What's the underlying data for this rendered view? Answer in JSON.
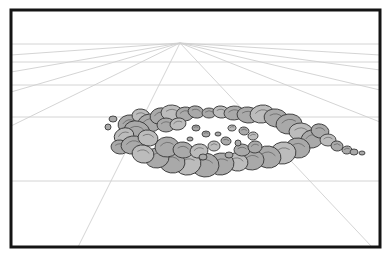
{
  "document": {
    "title": "Perspective Rock Ring Drawing",
    "type": "line-art-illustration",
    "subject": "ring of boulders on a one-point perspective ground plane",
    "canvas": {
      "width": 389,
      "height": 260,
      "background_color": "#ffffff"
    }
  },
  "frame": {
    "name": "illustration-border",
    "x": 11,
    "y": 10,
    "width": 369,
    "height": 237,
    "stroke_color": "#141414",
    "stroke_width": 3,
    "fill_color": "#ffffff"
  },
  "perspective_grid": {
    "line_color": "#cfcfcf",
    "line_width": 0.9,
    "vanishing_point": {
      "x": 180,
      "y": 43,
      "label": "vanishing point"
    },
    "horizon_note": "horizontal ground lines recede toward the vanishing point",
    "horizontal_lines_y": [
      44,
      62,
      85,
      117,
      181
    ],
    "radiating_lines": [
      {
        "id": "ray-left-1",
        "end_x": 11,
        "end_y": 55
      },
      {
        "id": "ray-left-2",
        "end_x": 11,
        "end_y": 72
      },
      {
        "id": "ray-left-3",
        "end_x": 11,
        "end_y": 92
      },
      {
        "id": "ray-left-4",
        "end_x": 11,
        "end_y": 126
      },
      {
        "id": "ray-bottom-left",
        "end_x": 78,
        "end_y": 247
      },
      {
        "id": "ray-right-1",
        "end_x": 380,
        "end_y": 55
      },
      {
        "id": "ray-right-2",
        "end_x": 380,
        "end_y": 70
      },
      {
        "id": "ray-right-3",
        "end_x": 380,
        "end_y": 90
      },
      {
        "id": "ray-right-4",
        "end_x": 380,
        "end_y": 122
      },
      {
        "id": "ray-bottom-right",
        "end_x": 372,
        "end_y": 247
      }
    ]
  },
  "rock_ring": {
    "name": "boulder-ring",
    "description": "elliptical ring of overlapping rounded boulders seen in perspective",
    "fill_color": "#a9a9a9",
    "fill_color_light": "#bcbcbc",
    "outline_color": "#3a3a3a",
    "outline_width": 0.9,
    "center": {
      "x": 222,
      "y": 136
    },
    "ellipse": {
      "rx": 105,
      "ry": 38
    },
    "interior_color": "#ffffff",
    "boulders": [
      {
        "cx": 129,
        "cy": 124,
        "rx": 11,
        "ry": 9,
        "rot": -12,
        "tone": "mid"
      },
      {
        "cx": 141,
        "cy": 116,
        "rx": 9,
        "ry": 7,
        "rot": 8,
        "tone": "light"
      },
      {
        "cx": 150,
        "cy": 123,
        "rx": 12,
        "ry": 9,
        "rot": -5,
        "tone": "mid"
      },
      {
        "cx": 137,
        "cy": 131,
        "rx": 13,
        "ry": 10,
        "rot": 14,
        "tone": "mid"
      },
      {
        "cx": 124,
        "cy": 136,
        "rx": 10,
        "ry": 8,
        "rot": -20,
        "tone": "light"
      },
      {
        "cx": 120,
        "cy": 147,
        "rx": 9,
        "ry": 7,
        "rot": 6,
        "tone": "mid"
      },
      {
        "cx": 133,
        "cy": 145,
        "rx": 12,
        "ry": 9,
        "rot": -8,
        "tone": "mid"
      },
      {
        "cx": 148,
        "cy": 138,
        "rx": 10,
        "ry": 8,
        "rot": 10,
        "tone": "light"
      },
      {
        "cx": 160,
        "cy": 116,
        "rx": 10,
        "ry": 8,
        "rot": -14,
        "tone": "mid"
      },
      {
        "cx": 172,
        "cy": 113,
        "rx": 11,
        "ry": 8,
        "rot": 4,
        "tone": "light"
      },
      {
        "cx": 185,
        "cy": 114,
        "rx": 9,
        "ry": 7,
        "rot": -6,
        "tone": "mid"
      },
      {
        "cx": 196,
        "cy": 112,
        "rx": 8,
        "ry": 6,
        "rot": 12,
        "tone": "mid"
      },
      {
        "cx": 166,
        "cy": 125,
        "rx": 9,
        "ry": 7,
        "rot": 0,
        "tone": "mid"
      },
      {
        "cx": 178,
        "cy": 124,
        "rx": 8,
        "ry": 6,
        "rot": -10,
        "tone": "light"
      },
      {
        "cx": 209,
        "cy": 113,
        "rx": 7,
        "ry": 5,
        "rot": 0,
        "tone": "mid"
      },
      {
        "cx": 221,
        "cy": 112,
        "rx": 8,
        "ry": 6,
        "rot": 8,
        "tone": "light"
      },
      {
        "cx": 234,
        "cy": 113,
        "rx": 10,
        "ry": 7,
        "rot": -4,
        "tone": "mid"
      },
      {
        "cx": 248,
        "cy": 115,
        "rx": 11,
        "ry": 8,
        "rot": 6,
        "tone": "mid"
      },
      {
        "cx": 262,
        "cy": 114,
        "rx": 12,
        "ry": 9,
        "rot": -8,
        "tone": "light"
      },
      {
        "cx": 276,
        "cy": 118,
        "rx": 12,
        "ry": 9,
        "rot": 10,
        "tone": "mid"
      },
      {
        "cx": 289,
        "cy": 124,
        "rx": 13,
        "ry": 10,
        "rot": -6,
        "tone": "mid"
      },
      {
        "cx": 301,
        "cy": 132,
        "rx": 12,
        "ry": 9,
        "rot": 4,
        "tone": "light"
      },
      {
        "cx": 312,
        "cy": 139,
        "rx": 11,
        "ry": 9,
        "rot": -12,
        "tone": "mid"
      },
      {
        "cx": 320,
        "cy": 131,
        "rx": 9,
        "ry": 7,
        "rot": 14,
        "tone": "mid"
      },
      {
        "cx": 328,
        "cy": 140,
        "rx": 8,
        "ry": 6,
        "rot": 0,
        "tone": "light"
      },
      {
        "cx": 337,
        "cy": 146,
        "rx": 6,
        "ry": 5,
        "rot": 8,
        "tone": "mid"
      },
      {
        "cx": 347,
        "cy": 150,
        "rx": 5,
        "ry": 4,
        "rot": -6,
        "tone": "mid"
      },
      {
        "cx": 298,
        "cy": 148,
        "rx": 12,
        "ry": 10,
        "rot": 6,
        "tone": "mid"
      },
      {
        "cx": 283,
        "cy": 153,
        "rx": 13,
        "ry": 11,
        "rot": -10,
        "tone": "light"
      },
      {
        "cx": 268,
        "cy": 157,
        "rx": 13,
        "ry": 11,
        "rot": 8,
        "tone": "mid"
      },
      {
        "cx": 252,
        "cy": 160,
        "rx": 12,
        "ry": 10,
        "rot": -4,
        "tone": "mid"
      },
      {
        "cx": 237,
        "cy": 162,
        "rx": 11,
        "ry": 9,
        "rot": 10,
        "tone": "light"
      },
      {
        "cx": 221,
        "cy": 164,
        "rx": 13,
        "ry": 11,
        "rot": -8,
        "tone": "mid"
      },
      {
        "cx": 205,
        "cy": 165,
        "rx": 14,
        "ry": 12,
        "rot": 5,
        "tone": "mid"
      },
      {
        "cx": 188,
        "cy": 164,
        "rx": 13,
        "ry": 11,
        "rot": -12,
        "tone": "light"
      },
      {
        "cx": 172,
        "cy": 162,
        "rx": 13,
        "ry": 11,
        "rot": 9,
        "tone": "mid"
      },
      {
        "cx": 157,
        "cy": 158,
        "rx": 12,
        "ry": 10,
        "rot": -6,
        "tone": "mid"
      },
      {
        "cx": 143,
        "cy": 154,
        "rx": 11,
        "ry": 9,
        "rot": 12,
        "tone": "light"
      },
      {
        "cx": 167,
        "cy": 147,
        "rx": 12,
        "ry": 10,
        "rot": -5,
        "tone": "mid"
      },
      {
        "cx": 183,
        "cy": 150,
        "rx": 10,
        "ry": 8,
        "rot": 7,
        "tone": "mid"
      },
      {
        "cx": 199,
        "cy": 151,
        "rx": 9,
        "ry": 7,
        "rot": -9,
        "tone": "light"
      },
      {
        "cx": 242,
        "cy": 150,
        "rx": 8,
        "ry": 6,
        "rot": 3,
        "tone": "mid"
      },
      {
        "cx": 255,
        "cy": 147,
        "rx": 7,
        "ry": 6,
        "rot": -7,
        "tone": "mid"
      },
      {
        "cx": 214,
        "cy": 146,
        "rx": 6,
        "ry": 5,
        "rot": 0,
        "tone": "light"
      },
      {
        "cx": 226,
        "cy": 141,
        "rx": 5,
        "ry": 4,
        "rot": 10,
        "tone": "mid"
      },
      {
        "cx": 206,
        "cy": 134,
        "rx": 4,
        "ry": 3,
        "rot": 0,
        "tone": "mid"
      },
      {
        "cx": 232,
        "cy": 128,
        "rx": 4,
        "ry": 3,
        "rot": -8,
        "tone": "light"
      },
      {
        "cx": 244,
        "cy": 131,
        "rx": 5,
        "ry": 4,
        "rot": 6,
        "tone": "mid"
      },
      {
        "cx": 196,
        "cy": 128,
        "rx": 4,
        "ry": 3,
        "rot": 0,
        "tone": "mid"
      },
      {
        "cx": 253,
        "cy": 136,
        "rx": 5,
        "ry": 4,
        "rot": -5,
        "tone": "light"
      }
    ],
    "scatter_stones": [
      {
        "cx": 354,
        "cy": 152,
        "rx": 4,
        "ry": 3
      },
      {
        "cx": 362,
        "cy": 153,
        "rx": 3,
        "ry": 2
      },
      {
        "cx": 113,
        "cy": 119,
        "rx": 4,
        "ry": 3
      },
      {
        "cx": 108,
        "cy": 127,
        "rx": 3,
        "ry": 3
      },
      {
        "cx": 190,
        "cy": 139,
        "rx": 3,
        "ry": 2
      },
      {
        "cx": 218,
        "cy": 134,
        "rx": 3,
        "ry": 2
      },
      {
        "cx": 238,
        "cy": 143,
        "rx": 3,
        "ry": 3
      },
      {
        "cx": 203,
        "cy": 157,
        "rx": 4,
        "ry": 3
      },
      {
        "cx": 229,
        "cy": 155,
        "rx": 4,
        "ry": 3
      }
    ]
  }
}
